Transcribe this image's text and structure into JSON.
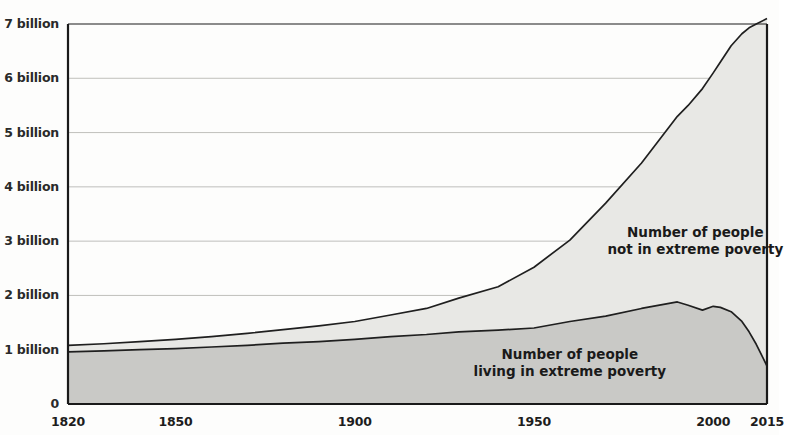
{
  "chart_data": {
    "type": "area",
    "title": "",
    "subtitle": "",
    "xlabel": "",
    "ylabel": "",
    "stacked": true,
    "grid": true,
    "legend_position": "inline-annotation",
    "xlim": [
      1820,
      2015
    ],
    "ylim": [
      0,
      7
    ],
    "y_unit": "billion people",
    "x_ticks": [
      1820,
      1850,
      1900,
      1950,
      2000,
      2015
    ],
    "x_tick_labels": [
      "1820",
      "1850",
      "1900",
      "1950",
      "2000",
      "2015"
    ],
    "y_ticks": [
      0,
      1,
      2,
      3,
      4,
      5,
      6,
      7
    ],
    "y_tick_labels": [
      "0",
      "1 billion",
      "2 billion",
      "3 billion",
      "4 billion",
      "5 billion",
      "6 billion",
      "7 billion"
    ],
    "colors": {
      "poverty_fill": "#c9c9c6",
      "not_poverty_fill": "#e8e8e5",
      "line": "#1f1f1f",
      "axis": "#1a1a1a",
      "grid": "#b9b9b4",
      "text": "#1a1a1a",
      "background": "#fdfdfc"
    },
    "annotations": [
      {
        "id": "not-in-poverty",
        "lines": [
          "Number of people",
          "not in extreme poverty"
        ],
        "x": 1995,
        "y": 3.0
      },
      {
        "id": "in-poverty",
        "lines": [
          "Number of people",
          "living in extreme poverty"
        ],
        "x": 1960,
        "y": 0.75
      }
    ],
    "x": [
      1820,
      1830,
      1840,
      1850,
      1860,
      1870,
      1880,
      1890,
      1900,
      1910,
      1920,
      1929,
      1940,
      1950,
      1960,
      1970,
      1980,
      1990,
      1993,
      1997,
      2000,
      2002,
      2005,
      2008,
      2010,
      2012,
      2015
    ],
    "series": [
      {
        "name": "Number of people living in extreme poverty",
        "key": "poverty",
        "values": [
          0.96,
          0.98,
          1.0,
          1.02,
          1.05,
          1.08,
          1.12,
          1.15,
          1.19,
          1.24,
          1.28,
          1.33,
          1.36,
          1.4,
          1.52,
          1.62,
          1.76,
          1.88,
          1.82,
          1.73,
          1.8,
          1.78,
          1.7,
          1.52,
          1.33,
          1.1,
          0.7
        ]
      },
      {
        "name": "Number of people not in extreme poverty",
        "key": "not_poverty",
        "values": [
          0.12,
          0.13,
          0.15,
          0.17,
          0.19,
          0.22,
          0.25,
          0.29,
          0.33,
          0.4,
          0.48,
          0.62,
          0.8,
          1.12,
          1.5,
          2.08,
          2.68,
          3.42,
          3.68,
          4.08,
          4.3,
          4.52,
          4.9,
          5.3,
          5.6,
          5.9,
          6.4
        ]
      }
    ],
    "totals": [
      1.08,
      1.11,
      1.15,
      1.19,
      1.24,
      1.3,
      1.37,
      1.44,
      1.52,
      1.64,
      1.76,
      1.95,
      2.16,
      2.52,
      3.02,
      3.7,
      4.44,
      5.3,
      5.5,
      5.81,
      6.1,
      6.3,
      6.6,
      6.82,
      6.93,
      7.0,
      7.1
    ]
  }
}
